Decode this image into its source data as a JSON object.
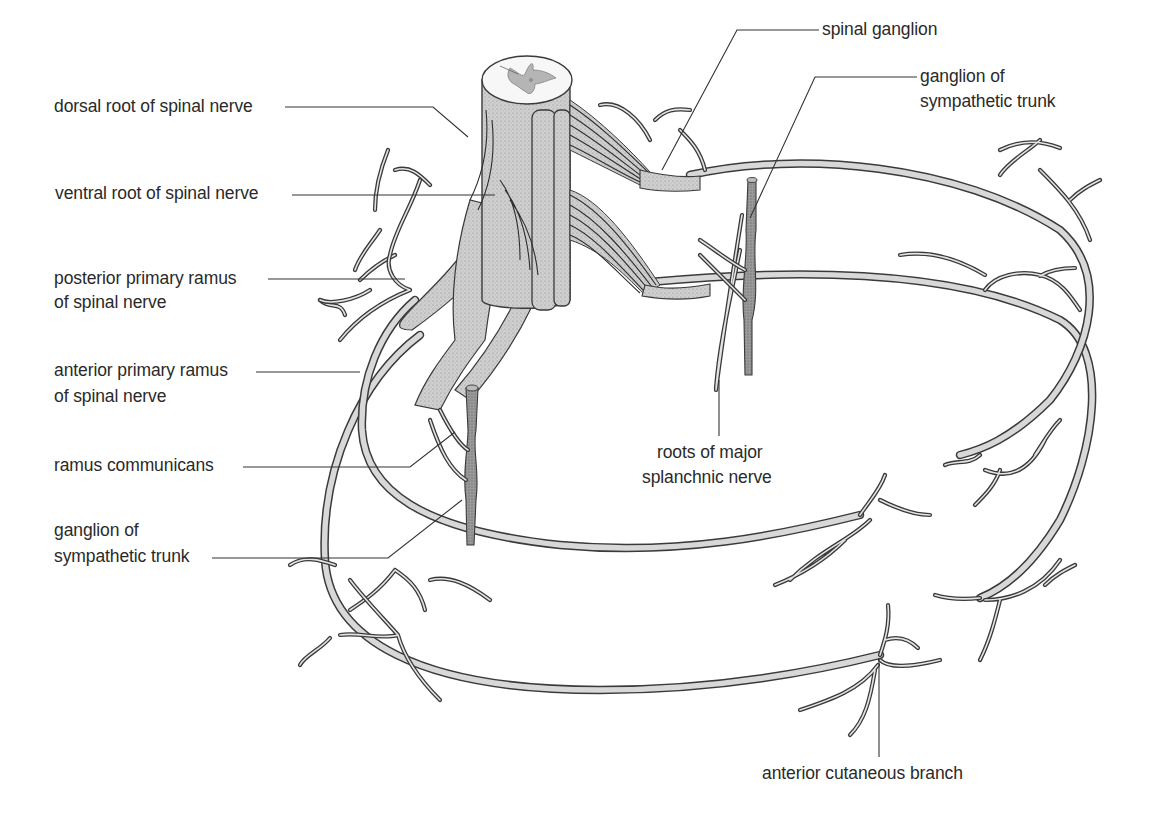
{
  "figure": {
    "colors": {
      "background": "#ffffff",
      "nerve_fill": "#d8d8d8",
      "nerve_outline": "#3a3a3a",
      "stipple_fill": "#c9c9c9",
      "ganglion_fill": "#8f8f8f",
      "grey_matter": "#b5b5b5",
      "label_text": "#2a2a2a"
    }
  },
  "labels": {
    "dorsal_root": "dorsal root of spinal nerve",
    "ventral_root": "ventral root of spinal nerve",
    "posterior_ramus_line1": "posterior primary ramus",
    "posterior_ramus_line2": "of spinal nerve",
    "anterior_ramus_line1": "anterior primary ramus",
    "anterior_ramus_line2": "of spinal nerve",
    "ramus_communicans": "ramus communicans",
    "ganglion_left_line1": "ganglion of",
    "ganglion_left_line2": "sympathetic trunk",
    "spinal_ganglion": "spinal ganglion",
    "ganglion_right_line1": "ganglion of",
    "ganglion_right_line2": "sympathetic trunk",
    "splanchnic_line1": "roots of major",
    "splanchnic_line2": "splanchnic nerve",
    "anterior_cutaneous": "anterior cutaneous branch"
  }
}
